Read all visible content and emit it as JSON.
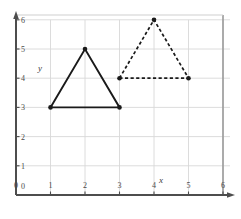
{
  "figure": {
    "background_color": "#ffffff",
    "frame_color": "#9a9a9a",
    "grid_color": "#d8d8d8",
    "axis_color": "#4d4d4d",
    "shape_color": "#1a1a1a",
    "x_axis_label": "x",
    "y_axis_label": "y",
    "x_tick_labels": [
      "0",
      "1",
      "2",
      "3",
      "4",
      "5",
      "6"
    ],
    "y_tick_labels": [
      "0",
      "1",
      "2",
      "3",
      "4",
      "5",
      "6"
    ]
  },
  "chart_data": {
    "type": "scatter",
    "title": "",
    "xlabel": "x",
    "ylabel": "y",
    "xlim": [
      0,
      6
    ],
    "ylim": [
      0,
      6
    ],
    "xticks": [
      0,
      1,
      2,
      3,
      4,
      5,
      6
    ],
    "yticks": [
      0,
      1,
      2,
      3,
      4,
      5,
      6
    ],
    "grid": true,
    "legend": "none",
    "series": [
      {
        "name": "solid-triangle",
        "linestyle": "solid",
        "color": "#1a1a1a",
        "marker": "dot",
        "closed": true,
        "points": [
          [
            1,
            3
          ],
          [
            2,
            5
          ],
          [
            3,
            3
          ]
        ]
      },
      {
        "name": "dashed-triangle",
        "linestyle": "dashed",
        "color": "#1a1a1a",
        "marker": "dot",
        "closed": true,
        "points": [
          [
            3,
            4
          ],
          [
            4,
            6
          ],
          [
            5,
            4
          ]
        ]
      }
    ]
  }
}
